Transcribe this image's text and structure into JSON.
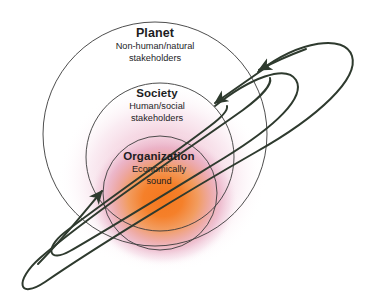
{
  "diagram": {
    "type": "concentric-venn-nested-spheres",
    "title_visible": false,
    "background_color": "#ffffff",
    "circle_stroke_color": "#3a3a3a",
    "orbit_stroke_color": "#2e3a2e",
    "text_color": "#1d1d1f",
    "gradient": {
      "core_color": "#f5802a",
      "mid_color": "#e8a8c0",
      "outer_color": "#ffffff"
    },
    "rings": [
      {
        "id": "planet",
        "title": "Planet",
        "subtitle_line1": "Non-human/natural",
        "subtitle_line2": "stakeholders",
        "level": 1,
        "cx": 155,
        "cy": 134,
        "r": 112
      },
      {
        "id": "society",
        "title": "Society",
        "subtitle_line1": "Human/social",
        "subtitle_line2": "stakeholders",
        "level": 2,
        "cx": 160,
        "cy": 157,
        "r": 74
      },
      {
        "id": "organization",
        "title": "Organization",
        "subtitle_line1": "Economically",
        "subtitle_line2": "sound",
        "level": 3,
        "cx": 160,
        "cy": 193,
        "r": 57
      }
    ],
    "orbits": [
      {
        "id": "outer-orbit",
        "rx": 150,
        "ry": 38,
        "cx": 180,
        "cy": 165,
        "rotation_deg": -37
      },
      {
        "id": "inner-orbit",
        "rx": 112,
        "ry": 27,
        "cx": 176,
        "cy": 170,
        "rotation_deg": -37
      }
    ],
    "arrowheads": [
      {
        "id": "arrow-into-planet",
        "x": 256,
        "y": 70,
        "angle_deg": 205
      },
      {
        "id": "arrow-into-society",
        "x": 212,
        "y": 104,
        "angle_deg": 205
      },
      {
        "id": "arrow-into-organization",
        "x": 104,
        "y": 189,
        "angle_deg": 35
      }
    ]
  }
}
